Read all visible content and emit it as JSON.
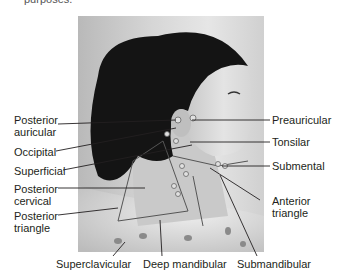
{
  "figure": {
    "cropped_header_text": "purposes.",
    "photo_description": "Profile photograph of a woman with ponytail, facing right, with neck lymph node chains illustrated",
    "labels_left": [
      {
        "id": "posterior-auricular",
        "text": "Posterior\nauricular",
        "line1": "Posterior",
        "line2": "auricular"
      },
      {
        "id": "occipital",
        "text": "Occipital"
      },
      {
        "id": "superficial",
        "text": "Superficial"
      },
      {
        "id": "posterior-cervical",
        "line1": "Posterior",
        "line2": "cervical"
      },
      {
        "id": "posterior-triangle",
        "line1": "Posterior",
        "line2": "triangle"
      }
    ],
    "labels_right": [
      {
        "id": "preauricular",
        "text": "Preauricular"
      },
      {
        "id": "tonsilar",
        "text": "Tonsilar"
      },
      {
        "id": "submental",
        "text": "Submental"
      },
      {
        "id": "anterior-triangle",
        "line1": "Anterior",
        "line2": "triangle"
      }
    ],
    "labels_bottom": [
      {
        "id": "superclavicular",
        "text": "Superclavicular"
      },
      {
        "id": "deep-mandibular",
        "text": "Deep mandibular"
      },
      {
        "id": "submandibular",
        "text": "Submandibular"
      }
    ],
    "colors": {
      "text": "#231f20",
      "leader_line": "#231f20",
      "hair": "#141414",
      "skin": "#d9d9d9",
      "background_photo": "#cfcfcf"
    }
  }
}
